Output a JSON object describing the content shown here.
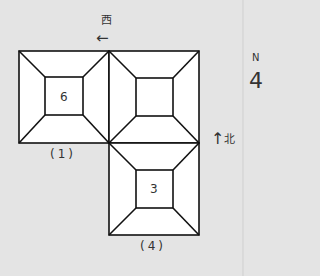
{
  "diagram": {
    "west_label": "西",
    "west_arrow": "←",
    "north_label": "北",
    "north_arrow": "↑",
    "compass_letter": "N",
    "compass_symbol": "4",
    "rooms": [
      {
        "number": "6",
        "caption": "(1)"
      },
      {
        "number": "",
        "caption": ""
      },
      {
        "number": "3",
        "caption": "(4)"
      }
    ],
    "colors": {
      "background": "#e4e4e4",
      "fill": "#ffffff",
      "stroke": "#111111"
    }
  }
}
